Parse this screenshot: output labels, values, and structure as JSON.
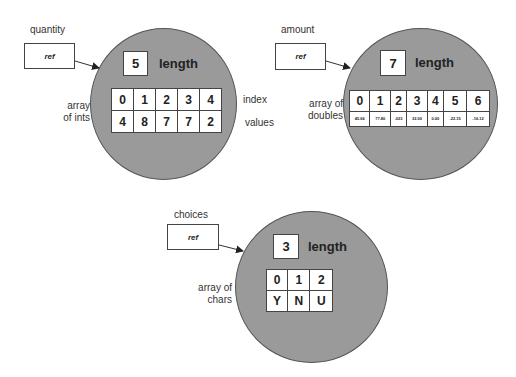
{
  "diagrams": [
    {
      "variable": "quantity",
      "ref_label": "ref",
      "length": "5",
      "length_label": "length",
      "type_label_line1": "array",
      "type_label_line2": "of ints",
      "index_label": "index",
      "values_label": "values",
      "indices": [
        "0",
        "1",
        "2",
        "3",
        "4"
      ],
      "values": [
        "4",
        "8",
        "7",
        "7",
        "2"
      ]
    },
    {
      "variable": "amount",
      "ref_label": "ref",
      "length": "7",
      "length_label": "length",
      "type_label_line1": "array of",
      "type_label_line2": "doubles",
      "indices": [
        "0",
        "1",
        "2",
        "3",
        "4",
        "5",
        "6"
      ],
      "values": [
        "45.66",
        "77.80",
        ".023",
        "32.00",
        "0.00",
        "-22.15",
        "-16.12"
      ]
    },
    {
      "variable": "choices",
      "ref_label": "ref",
      "length": "3",
      "length_label": "length",
      "type_label_line1": "array of",
      "type_label_line2": "chars",
      "indices": [
        "0",
        "1",
        "2"
      ],
      "values": [
        "Y",
        "N",
        "U"
      ]
    }
  ],
  "colors": {
    "circle_fill": "#9a9a9a",
    "box_fill": "#ffffff",
    "stroke": "#444444"
  }
}
